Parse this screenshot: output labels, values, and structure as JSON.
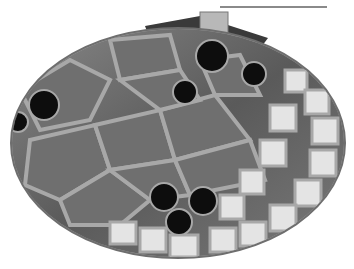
{
  "image": {
    "subject": "grayscale mosaic oval box",
    "description": "Oval mosaic tile lid with grout lines, dark round tiles, light square border tiles on right and bottom, clasp at top",
    "palette": {
      "background": "#ffffff",
      "grout": "#a8a8a8",
      "rim": "#6e6e6e",
      "dark_tile": "#0e0e0e",
      "mid_tile": "#7a7a7a",
      "light_tile": "#e6e6e6"
    }
  }
}
